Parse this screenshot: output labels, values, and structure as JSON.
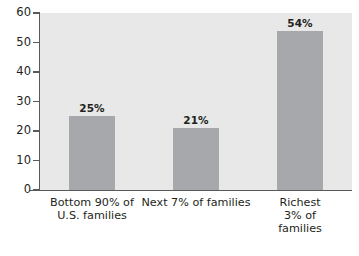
{
  "chart_data": {
    "type": "bar",
    "title": "",
    "subtitle": "",
    "xlabel": "",
    "ylabel": "",
    "categories": [
      "Bottom 90% of\nU.S. families",
      "Next 7% of families",
      "Richest 3% of families"
    ],
    "values": [
      25,
      21,
      54
    ],
    "data_labels": [
      "25%",
      "21%",
      "54%"
    ],
    "ylim": [
      0,
      60
    ],
    "yticks": [
      0,
      10,
      20,
      30,
      40,
      50,
      60
    ],
    "ytick_labels": [
      "0",
      "10",
      "20",
      "30",
      "40",
      "50",
      "60"
    ],
    "grid": false,
    "legend": false,
    "legend_position": "none",
    "colors": {
      "bar_fill": "#a6a8ab",
      "plot_background": "#e8e8e8",
      "figure_background": "#ffffff",
      "axis_line": "#58595b",
      "text": "#231f20"
    }
  }
}
